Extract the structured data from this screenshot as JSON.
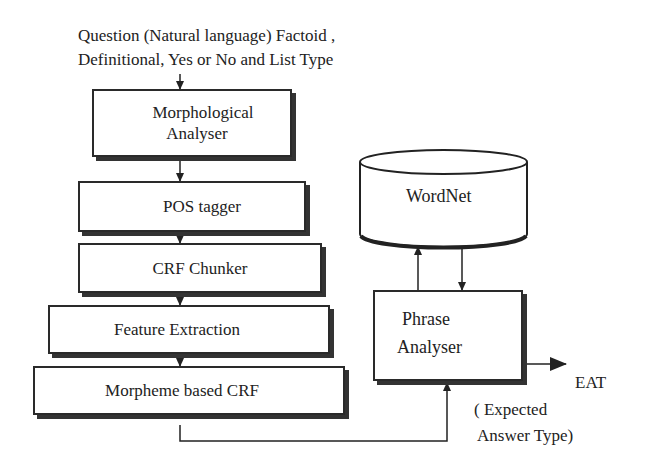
{
  "input": {
    "line1": "Question (Natural language) Factoid ,",
    "line2": "Definitional, Yes or No and List Type"
  },
  "pipeline": [
    {
      "id": "morphological-analyser",
      "label_line1": "Morphological",
      "label_line2": "Analyser"
    },
    {
      "id": "pos-tagger",
      "label": "POS tagger"
    },
    {
      "id": "crf-chunker",
      "label": "CRF Chunker"
    },
    {
      "id": "feature-extraction",
      "label": "Feature Extraction"
    },
    {
      "id": "morpheme-based-crf",
      "label": "Morpheme based CRF"
    }
  ],
  "wordnet": {
    "label": "WordNet"
  },
  "phrase_analyser": {
    "label_line1": "Phrase",
    "label_line2": "Analyser"
  },
  "output": {
    "label": "EAT",
    "desc_line1": "( Expected",
    "desc_line2": "Answer Type)"
  }
}
